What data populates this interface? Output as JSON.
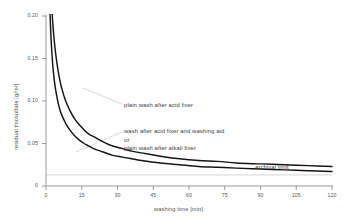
{
  "chart_data": {
    "type": "line",
    "title": "",
    "xlabel": "washing time [min]",
    "ylabel": "residual thiosulfate [g/m²]",
    "xlim": [
      0,
      120
    ],
    "ylim": [
      0,
      0.2
    ],
    "xticks": [
      "0",
      "15",
      "30",
      "45",
      "60",
      "75",
      "90",
      "105",
      "120"
    ],
    "xtick_values": [
      0,
      15,
      30,
      45,
      60,
      75,
      90,
      105,
      120
    ],
    "yticks": [
      "0",
      "0.05",
      "0.10",
      "0.15",
      "0.20"
    ],
    "ytick_values": [
      0,
      0.05,
      0.1,
      0.15,
      0.2
    ],
    "grid": false,
    "legend_position": "inline-annotations",
    "line_color": "#1a1a1a",
    "gridline_color": "#c8c8c8",
    "leader_color": "#bdbdbd",
    "axis_color": "#8a8a8a",
    "reference_lines": [
      {
        "name": "archival-limit",
        "label": "archival limit",
        "value": 0.013,
        "orientation": "horizontal"
      }
    ],
    "series": [
      {
        "name": "plain wash after acid fixer",
        "x": [
          2.0,
          2.5,
          3,
          3.5,
          4,
          5,
          6,
          7,
          8,
          9,
          10,
          12,
          14,
          16,
          18,
          20,
          24,
          28,
          32,
          36,
          40,
          48,
          56,
          64,
          72,
          80,
          90,
          100,
          110,
          120
        ],
        "values": [
          0.233,
          0.206,
          0.186,
          0.17,
          0.157,
          0.137,
          0.122,
          0.111,
          0.102,
          0.095,
          0.089,
          0.079,
          0.072,
          0.066,
          0.061,
          0.058,
          0.052,
          0.047,
          0.044,
          0.041,
          0.039,
          0.035,
          0.032,
          0.03,
          0.029,
          0.027,
          0.026,
          0.025,
          0.024,
          0.023
        ]
      },
      {
        "name": "wash after acid fixer and washing aid or plain wash after alkali fixer",
        "x": [
          1.3,
          1.6,
          2,
          2.5,
          3,
          3.5,
          4,
          5,
          6,
          7,
          8,
          9,
          10,
          12,
          14,
          16,
          18,
          20,
          24,
          28,
          32,
          36,
          40,
          48,
          56,
          64,
          72,
          80,
          90,
          100,
          110,
          120
        ],
        "values": [
          0.236,
          0.209,
          0.181,
          0.155,
          0.137,
          0.124,
          0.114,
          0.099,
          0.088,
          0.081,
          0.075,
          0.07,
          0.066,
          0.059,
          0.054,
          0.05,
          0.047,
          0.044,
          0.04,
          0.036,
          0.034,
          0.032,
          0.03,
          0.027,
          0.025,
          0.023,
          0.022,
          0.021,
          0.02,
          0.019,
          0.018,
          0.017
        ]
      }
    ],
    "annotations": [
      {
        "name": "upper-curve-label",
        "text": "plain wash after acid fixer"
      },
      {
        "name": "lower-curve-label-line1",
        "text": "wash after acid fixer and washing aid"
      },
      {
        "name": "lower-curve-label-line2",
        "text": "or"
      },
      {
        "name": "lower-curve-label-line3",
        "text": "plain wash after alkali fixer"
      },
      {
        "name": "archival-limit-label",
        "text": "archival limit"
      }
    ]
  }
}
